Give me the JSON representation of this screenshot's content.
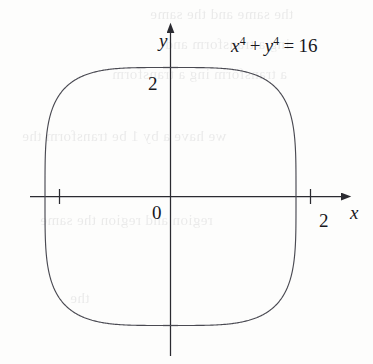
{
  "figure": {
    "kind": "cartesian-plot",
    "width": 373,
    "height": 364,
    "background_color": "#fdfdfc",
    "ink_color": "#17171c",
    "curve_color": "#4a4a52",
    "axis_color": "#2b2b31"
  },
  "labels": {
    "x_axis_name": "x",
    "y_axis_name": "y",
    "origin": "0",
    "x_tick": "2",
    "y_tick": "2"
  },
  "equation": {
    "base_x": "x",
    "exp_x": "4",
    "plus": "+",
    "base_y": "y",
    "exp_y": "4",
    "equals": "=",
    "rhs": "16",
    "full_text": "x4 + y4 = 16"
  },
  "bleed_through_lines": [
    {
      "text": "the same and the same",
      "left": 150,
      "top": 6,
      "size": 15
    },
    {
      "text": "ing a transform  and",
      "left": 165,
      "top": 36,
      "size": 15
    },
    {
      "text": "a transform  ing a transform",
      "left": 112,
      "top": 66,
      "size": 15
    },
    {
      "text": "we have a by 1 be transform  the",
      "left": 22,
      "top": 128,
      "size": 15
    },
    {
      "text": "region  and  region  the  same",
      "left": 40,
      "top": 212,
      "size": 15
    },
    {
      "text": "the",
      "left": 70,
      "top": 290,
      "size": 14
    }
  ],
  "chart_data": {
    "type": "line",
    "title": "",
    "annotations": [
      "x^4 + y^4 = 16"
    ],
    "equation": "x^4 + y^4 = 16",
    "curve_family": "superellipse",
    "exponent": 4,
    "semi_axis_x": 2,
    "semi_axis_y": 2,
    "closed": true,
    "xlabel": "x",
    "ylabel": "y",
    "xlim": [
      -2.6,
      2.6
    ],
    "ylim": [
      -2.6,
      2.6
    ],
    "xticks": [
      2
    ],
    "yticks": [
      2
    ],
    "xticklabels": [
      "2"
    ],
    "yticklabels": [
      "2"
    ],
    "grid": false,
    "legend": null,
    "axis_arrows": {
      "x_positive": true,
      "y_positive": true
    },
    "intercepts": {
      "x": [
        -2,
        2
      ],
      "y": [
        -2,
        2
      ]
    },
    "sample_points": [
      [
        2.0,
        0.0
      ],
      [
        1.999,
        0.5
      ],
      [
        1.99,
        0.95
      ],
      [
        1.96,
        1.3
      ],
      [
        1.88,
        1.55
      ],
      [
        1.75,
        1.75
      ],
      [
        1.55,
        1.88
      ],
      [
        1.3,
        1.96
      ],
      [
        0.95,
        1.99
      ],
      [
        0.5,
        1.999
      ],
      [
        0.0,
        2.0
      ],
      [
        -0.5,
        1.999
      ],
      [
        -0.95,
        1.99
      ],
      [
        -1.3,
        1.96
      ],
      [
        -1.55,
        1.88
      ],
      [
        -1.75,
        1.75
      ],
      [
        -1.88,
        1.55
      ],
      [
        -1.96,
        1.3
      ],
      [
        -1.99,
        0.95
      ],
      [
        -1.999,
        0.5
      ],
      [
        -2.0,
        0.0
      ],
      [
        -1.999,
        -0.5
      ],
      [
        -1.99,
        -0.95
      ],
      [
        -1.96,
        -1.3
      ],
      [
        -1.88,
        -1.55
      ],
      [
        -1.75,
        -1.75
      ],
      [
        -1.55,
        -1.88
      ],
      [
        -1.3,
        -1.96
      ],
      [
        -0.95,
        -1.99
      ],
      [
        -0.5,
        -1.999
      ],
      [
        0.0,
        -2.0
      ],
      [
        0.5,
        -1.999
      ],
      [
        0.95,
        -1.99
      ],
      [
        1.3,
        -1.96
      ],
      [
        1.55,
        -1.88
      ],
      [
        1.75,
        -1.75
      ],
      [
        1.88,
        -1.55
      ],
      [
        1.96,
        -1.3
      ],
      [
        1.99,
        -0.95
      ],
      [
        1.999,
        -0.5
      ],
      [
        2.0,
        0.0
      ]
    ]
  }
}
